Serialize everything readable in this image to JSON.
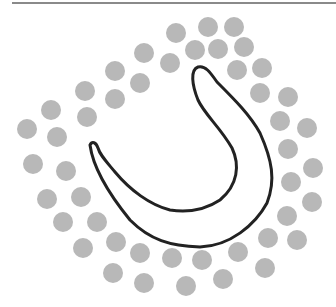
{
  "figure": {
    "colors": {
      "dot": "#b8b8b8",
      "outline": "#222222",
      "rule": "#8a8a8a",
      "background": "#ffffff"
    },
    "dot_radius": 10,
    "outer_ring": [
      [
        176,
        33
      ],
      [
        208,
        27
      ],
      [
        234,
        27
      ],
      [
        144,
        53
      ],
      [
        115,
        71
      ],
      [
        85,
        91
      ],
      [
        51,
        110
      ],
      [
        27,
        129
      ],
      [
        33,
        164
      ],
      [
        47,
        199
      ],
      [
        63,
        222
      ],
      [
        83,
        248
      ],
      [
        113,
        273
      ],
      [
        144,
        283
      ],
      [
        186,
        286
      ],
      [
        223,
        279
      ],
      [
        265,
        268
      ],
      [
        297,
        240
      ],
      [
        312,
        202
      ],
      [
        313,
        168
      ],
      [
        307,
        128
      ],
      [
        288,
        97
      ],
      [
        262,
        68
      ],
      [
        244,
        47
      ]
    ],
    "inner_ring": [
      [
        195,
        50
      ],
      [
        218,
        49
      ],
      [
        170,
        63
      ],
      [
        140,
        83
      ],
      [
        115,
        99
      ],
      [
        87,
        117
      ],
      [
        57,
        137
      ],
      [
        66,
        171
      ],
      [
        81,
        197
      ],
      [
        97,
        222
      ],
      [
        116,
        242
      ],
      [
        140,
        253
      ],
      [
        172,
        258
      ],
      [
        202,
        260
      ],
      [
        238,
        252
      ],
      [
        268,
        238
      ],
      [
        287,
        216
      ],
      [
        291,
        182
      ],
      [
        288,
        149
      ],
      [
        280,
        121
      ],
      [
        260,
        93
      ],
      [
        237,
        70
      ]
    ],
    "u_outline_path": "M90,145 C92,160 100,183 130,220 C150,240 170,246 200,247 C230,246 255,225 267,203 C276,180 272,160 260,133 C250,115 235,100 217,82 C210,72 205,65 198,67 C190,70 192,85 198,100 C205,115 220,127 232,148 C240,165 238,185 220,200 C205,210 190,213 170,210 C150,205 130,190 115,172 C105,160 100,155 98,148 C96,142 92,141 90,145 Z"
  }
}
